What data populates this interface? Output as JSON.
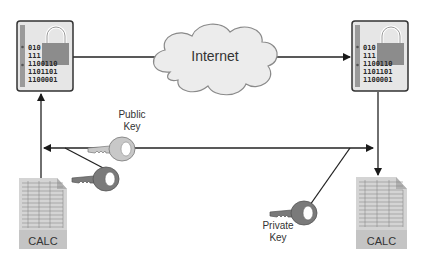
{
  "diagram": {
    "type": "public-key-encryption-flow",
    "cloud": {
      "label": "Internet"
    },
    "servers": [
      {
        "id": "sender-server",
        "binary": [
          "010",
          "111",
          "1100110",
          "1101101",
          "1100001"
        ],
        "locked": true
      },
      {
        "id": "receiver-server",
        "binary": [
          "010",
          "111",
          "1100110",
          "1101101",
          "1100001"
        ],
        "locked": true
      }
    ],
    "documents": [
      {
        "id": "sender-doc",
        "label": "CALC"
      },
      {
        "id": "receiver-doc",
        "label": "CALC"
      }
    ],
    "keys": {
      "public": {
        "label_line1": "Public",
        "label_line2": "Key"
      },
      "private": {
        "label_line1": "Private",
        "label_line2": "Key"
      }
    },
    "colors": {
      "line": "#222222",
      "key_light": "#c8c8c8",
      "key_dark": "#7a7a7a",
      "lock": "#8c8c8c",
      "server_bg": "#e6e6e6",
      "doc_bg": "#d4d4d4",
      "cloud_fill": "#ececec"
    }
  }
}
